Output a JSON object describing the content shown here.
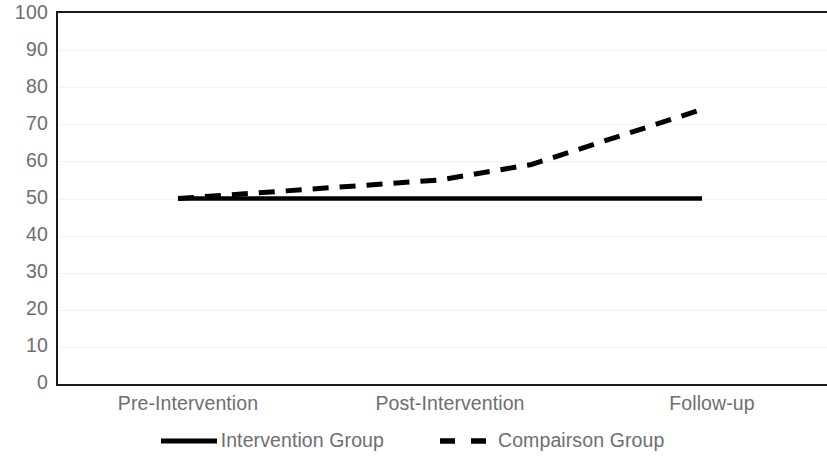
{
  "chart_data": {
    "type": "line",
    "title": "",
    "xlabel": "",
    "ylabel": "",
    "categories": [
      "Pre-Intervention",
      "Post-Intervention",
      "Follow-up"
    ],
    "ylim": [
      0,
      100
    ],
    "y_ticks": [
      0,
      10,
      20,
      30,
      40,
      50,
      60,
      70,
      80,
      90,
      100
    ],
    "grid": true,
    "grid_axis": "y",
    "legend_position": "bottom",
    "series": [
      {
        "name": "Intervention Group",
        "style": "solid",
        "color": "#000000",
        "values": [
          50,
          50,
          50
        ]
      },
      {
        "name": "Compairson Group",
        "style": "dashed",
        "color": "#000000",
        "values": [
          50,
          55,
          74
        ]
      }
    ]
  },
  "axes": {
    "y_tick_labels": [
      "100",
      "90",
      "80",
      "70",
      "60",
      "50",
      "40",
      "30",
      "20",
      "10",
      "0"
    ],
    "x_tick_labels": [
      "Pre-Intervention",
      "Post-Intervention",
      "Follow-up"
    ]
  },
  "legend": {
    "entries": [
      {
        "label": "Intervention Group",
        "style": "solid"
      },
      {
        "label": "Compairson Group",
        "style": "dashed"
      }
    ]
  },
  "colors": {
    "axis_line": "#1a1a1a",
    "tick_text": "#6e6e6e",
    "gridline": "#f2f2f2",
    "series_line": "#000000",
    "background": "#ffffff"
  }
}
